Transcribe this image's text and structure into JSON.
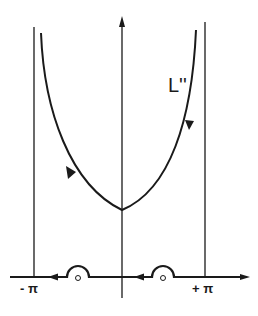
{
  "diagram": {
    "curve_label": "L''",
    "left_label": "- π",
    "right_label": "+ π",
    "colors": {
      "ink": "#1a1a1a",
      "background": "#ffffff"
    },
    "elements": {
      "horizontal_axis": "real axis with arrow pointing right",
      "vertical_axis": "imaginary axis with arrow pointing up",
      "left_boundary": "vertical line at -π",
      "right_boundary": "vertical line at +π",
      "contour": "U-shaped contour L'' traversed down the right side and up the left side",
      "indentations": [
        {
          "position": "between -π and 0",
          "shape": "semicircle above pole"
        },
        {
          "position": "between 0 and +π",
          "shape": "semicircle above pole"
        }
      ],
      "axis_direction_arrows": [
        "leftward near -π",
        "leftward right of origin"
      ]
    }
  }
}
